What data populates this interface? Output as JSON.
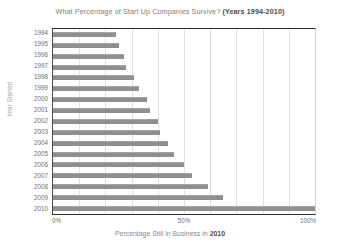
{
  "chart_data": {
    "type": "bar",
    "orientation": "horizontal",
    "title": "What Percentage of Start Up Companies Survive? (Years 1994-2010)",
    "title_main": "What Percentage of Start Up Companies Survive?",
    "title_years": "(Years 1994-2010)",
    "xlabel": "Percentage Still in Business in 2010",
    "xlabel_main": "Percentage Still in Business in",
    "xlabel_year": "2010",
    "ylabel": "Year Started",
    "categories": [
      "1994",
      "1995",
      "1996",
      "1997",
      "1998",
      "1999",
      "2000",
      "2001",
      "2002",
      "2003",
      "2004",
      "2005",
      "2006",
      "2007",
      "2008",
      "2009",
      "2010"
    ],
    "values": [
      24,
      25,
      27,
      28,
      31,
      33,
      36,
      37,
      40,
      41,
      44,
      46,
      50,
      53,
      59,
      65,
      100
    ],
    "xlim": [
      0,
      100
    ],
    "xticks": [
      0,
      50,
      100
    ],
    "xtick_labels": [
      "0%",
      "50%",
      "100%"
    ],
    "gridlines": [
      10,
      20,
      30,
      40,
      50,
      60,
      70,
      80,
      90
    ],
    "grid": true,
    "legend": "none",
    "bar_color": "#8f8f8f",
    "axis_color": "#2f2f2f",
    "grid_color": "#dedede"
  }
}
